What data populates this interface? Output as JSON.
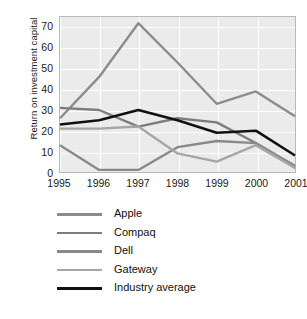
{
  "chart_data": {
    "type": "line",
    "title": "",
    "subtitle": "",
    "xlabel": "",
    "ylabel": "Return on investment capital",
    "categories": [
      "1995",
      "1996",
      "1997",
      "1998",
      "1999",
      "2000",
      "2001"
    ],
    "x": [
      1995,
      1996,
      1997,
      1998,
      1999,
      2000,
      2001
    ],
    "xlim": [
      1995,
      2001
    ],
    "ylim": [
      0,
      75
    ],
    "yticks": [
      0,
      10,
      20,
      30,
      40,
      50,
      60,
      70
    ],
    "xticks": [
      "1995",
      "1996",
      "1997",
      "1998",
      "1999",
      "2000",
      "2001"
    ],
    "grid": true,
    "grid_color": "#ffffff",
    "plot_background": "#ebebeb",
    "legend_position": "bottom",
    "series": [
      {
        "name": "Apple",
        "color": "#8c8c8c",
        "values": [
          26,
          46,
          72,
          53,
          33,
          39,
          27
        ]
      },
      {
        "name": "Compaq",
        "color": "#7d7d7d",
        "values": [
          31,
          30,
          22,
          26,
          24,
          14,
          2
        ]
      },
      {
        "name": "Dell",
        "color": "#898989",
        "values": [
          13,
          1,
          1,
          12,
          15,
          14,
          3
        ]
      },
      {
        "name": "Gateway",
        "color": "#a6a6a6",
        "values": [
          21,
          21,
          22,
          9,
          5,
          13,
          2
        ]
      },
      {
        "name": "Industry average",
        "color": "#111111",
        "values": [
          23,
          25,
          30,
          25,
          19,
          20,
          8
        ]
      }
    ]
  },
  "axis": {
    "y_title": "Return on investment capital",
    "y_tick_labels": [
      "70",
      "60",
      "50",
      "40",
      "30",
      "20",
      "10",
      "0"
    ],
    "x_tick_labels": [
      "1995",
      "1996",
      "1997",
      "1998",
      "1999",
      "2000",
      "2001"
    ]
  },
  "legend": {
    "items": [
      {
        "label": "Apple",
        "color": "#8c8c8c"
      },
      {
        "label": "Compaq",
        "color": "#7d7d7d"
      },
      {
        "label": "Dell",
        "color": "#898989"
      },
      {
        "label": "Gateway",
        "color": "#a6a6a6"
      },
      {
        "label": "Industry average",
        "color": "#111111"
      }
    ]
  }
}
